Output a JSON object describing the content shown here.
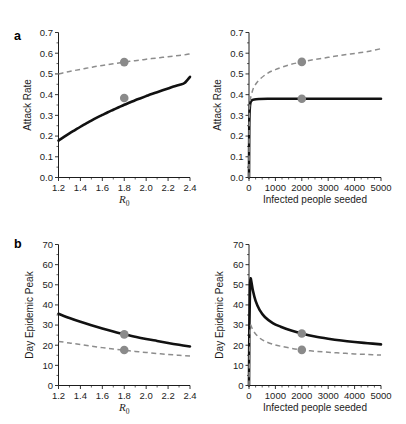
{
  "figure": {
    "background_color": "#ffffff",
    "solid_color": "#111111",
    "dashed_color": "#8d8d8d",
    "marker_color": "#8a8a8a",
    "panel_a_letter": "a",
    "panel_b_letter": "b"
  },
  "chart_data": [
    {
      "id": "panel-a-left",
      "type": "line",
      "panel": "a",
      "title": "",
      "xlabel": "R_0",
      "xlabel_base": "R",
      "xlabel_sub": "0",
      "ylabel": "Attack Rate",
      "xlim": [
        1.2,
        2.4
      ],
      "ylim": [
        0.0,
        0.7
      ],
      "xticks": [
        1.2,
        1.4,
        1.6,
        1.8,
        2.0,
        2.2,
        2.4
      ],
      "xtick_labels": [
        "1.2",
        "1.4",
        "1.6",
        "1.8",
        "2.0",
        "2.2",
        "2.4"
      ],
      "yticks": [
        0.0,
        0.1,
        0.2,
        0.3,
        0.4,
        0.5,
        0.6,
        0.7
      ],
      "ytick_labels": [
        "0.0",
        "0.1",
        "0.2",
        "0.3",
        "0.4",
        "0.5",
        "0.6",
        "0.7"
      ],
      "grid": false,
      "legend": "none",
      "series": [
        {
          "name": "solid",
          "style": "solid",
          "x": [
            1.2,
            1.25,
            1.3,
            1.35,
            1.4,
            1.45,
            1.5,
            1.55,
            1.6,
            1.65,
            1.7,
            1.75,
            1.8,
            1.85,
            1.9,
            1.95,
            2.0,
            2.05,
            2.1,
            2.15,
            2.2,
            2.25,
            2.3,
            2.35,
            2.4
          ],
          "y": [
            0.178,
            0.196,
            0.213,
            0.229,
            0.245,
            0.26,
            0.275,
            0.289,
            0.302,
            0.315,
            0.327,
            0.339,
            0.351,
            0.362,
            0.373,
            0.383,
            0.393,
            0.403,
            0.412,
            0.421,
            0.43,
            0.439,
            0.447,
            0.456,
            0.486
          ]
        },
        {
          "name": "dashed",
          "style": "dashed",
          "x": [
            1.2,
            1.25,
            1.3,
            1.35,
            1.4,
            1.45,
            1.5,
            1.55,
            1.6,
            1.65,
            1.7,
            1.75,
            1.8,
            1.85,
            1.9,
            1.95,
            2.0,
            2.05,
            2.1,
            2.15,
            2.2,
            2.25,
            2.3,
            2.35,
            2.4
          ],
          "y": [
            0.5,
            0.506,
            0.512,
            0.517,
            0.522,
            0.527,
            0.532,
            0.537,
            0.541,
            0.545,
            0.549,
            0.553,
            0.557,
            0.561,
            0.564,
            0.567,
            0.571,
            0.574,
            0.577,
            0.58,
            0.583,
            0.586,
            0.589,
            0.592,
            0.597
          ]
        }
      ],
      "markers": [
        {
          "x": 1.8,
          "y": 0.384,
          "series": "solid"
        },
        {
          "x": 1.8,
          "y": 0.557,
          "series": "dashed"
        }
      ]
    },
    {
      "id": "panel-a-right",
      "type": "line",
      "panel": "a",
      "title": "",
      "xlabel": "Infected people seeded",
      "ylabel": "Attack Rate",
      "xlim": [
        0,
        5000
      ],
      "ylim": [
        0.0,
        0.7
      ],
      "xticks": [
        0,
        1000,
        2000,
        3000,
        4000,
        5000
      ],
      "xtick_labels": [
        "0",
        "1000",
        "2000",
        "3000",
        "4000",
        "5000"
      ],
      "yticks": [
        0.0,
        0.1,
        0.2,
        0.3,
        0.4,
        0.5,
        0.6,
        0.7
      ],
      "ytick_labels": [
        "0.0",
        "0.1",
        "0.2",
        "0.3",
        "0.4",
        "0.5",
        "0.6",
        "0.7"
      ],
      "grid": false,
      "legend": "none",
      "series": [
        {
          "name": "solid",
          "style": "solid",
          "x": [
            0,
            10,
            25,
            50,
            100,
            200,
            400,
            700,
            1000,
            1500,
            2000,
            2500,
            3000,
            3500,
            4000,
            4500,
            5000
          ],
          "y": [
            0.0,
            0.24,
            0.325,
            0.359,
            0.372,
            0.377,
            0.379,
            0.38,
            0.38,
            0.38,
            0.38,
            0.38,
            0.38,
            0.38,
            0.38,
            0.38,
            0.38
          ]
        },
        {
          "name": "dashed",
          "style": "dashed",
          "x": [
            0,
            10,
            25,
            50,
            100,
            200,
            400,
            700,
            1000,
            1500,
            2000,
            2500,
            3000,
            3500,
            4000,
            4500,
            5000
          ],
          "y": [
            0.0,
            0.3,
            0.345,
            0.375,
            0.405,
            0.44,
            0.473,
            0.503,
            0.521,
            0.543,
            0.558,
            0.57,
            0.58,
            0.59,
            0.599,
            0.608,
            0.622
          ]
        }
      ],
      "markers": [
        {
          "x": 2000,
          "y": 0.38,
          "series": "solid"
        },
        {
          "x": 2000,
          "y": 0.558,
          "series": "dashed"
        }
      ]
    },
    {
      "id": "panel-b-left",
      "type": "line",
      "panel": "b",
      "title": "",
      "xlabel": "R_0",
      "xlabel_base": "R",
      "xlabel_sub": "0",
      "ylabel": "Day Epidemic Peak",
      "xlim": [
        1.2,
        2.4
      ],
      "ylim": [
        0,
        70
      ],
      "xticks": [
        1.2,
        1.4,
        1.6,
        1.8,
        2.0,
        2.2,
        2.4
      ],
      "xtick_labels": [
        "1.2",
        "1.4",
        "1.6",
        "1.8",
        "2.0",
        "2.2",
        "2.4"
      ],
      "yticks": [
        0,
        10,
        20,
        30,
        40,
        50,
        60,
        70
      ],
      "ytick_labels": [
        "0",
        "10",
        "20",
        "30",
        "40",
        "50",
        "60",
        "70"
      ],
      "grid": false,
      "legend": "none",
      "series": [
        {
          "name": "solid",
          "style": "solid",
          "x": [
            1.2,
            1.3,
            1.4,
            1.5,
            1.6,
            1.7,
            1.8,
            1.9,
            2.0,
            2.1,
            2.2,
            2.3,
            2.4
          ],
          "y": [
            35.6,
            33.5,
            31.6,
            29.9,
            28.3,
            26.8,
            25.4,
            24.2,
            23.1,
            22.1,
            21.1,
            20.2,
            19.4
          ]
        },
        {
          "name": "dashed",
          "style": "dashed",
          "x": [
            1.2,
            1.3,
            1.4,
            1.5,
            1.6,
            1.7,
            1.8,
            1.9,
            2.0,
            2.1,
            2.2,
            2.3,
            2.4
          ],
          "y": [
            21.9,
            21.1,
            20.3,
            19.5,
            18.8,
            18.1,
            17.5,
            16.9,
            16.4,
            15.9,
            15.4,
            15.0,
            14.6
          ]
        }
      ],
      "markers": [
        {
          "x": 1.8,
          "y": 25.4,
          "series": "solid"
        },
        {
          "x": 1.8,
          "y": 17.6,
          "series": "dashed"
        }
      ]
    },
    {
      "id": "panel-b-right",
      "type": "line",
      "panel": "b",
      "title": "",
      "xlabel": "Infected people seeded",
      "ylabel": "Day Epidemic Peak",
      "xlim": [
        0,
        5000
      ],
      "ylim": [
        0,
        70
      ],
      "xticks": [
        0,
        1000,
        2000,
        3000,
        4000,
        5000
      ],
      "xtick_labels": [
        "0",
        "1000",
        "2000",
        "3000",
        "4000",
        "5000"
      ],
      "yticks": [
        0,
        10,
        20,
        30,
        40,
        50,
        60,
        70
      ],
      "ytick_labels": [
        "0",
        "10",
        "20",
        "30",
        "40",
        "50",
        "60",
        "70"
      ],
      "grid": false,
      "legend": "none",
      "series": [
        {
          "name": "solid",
          "style": "solid",
          "x": [
            0,
            15,
            40,
            60,
            90,
            150,
            250,
            400,
            600,
            900,
            1200,
            1600,
            2000,
            2500,
            3000,
            3500,
            4000,
            4500,
            5000
          ],
          "y": [
            0,
            30,
            50,
            53.2,
            51.5,
            47.0,
            42.0,
            37.5,
            34.0,
            31.0,
            29.2,
            27.3,
            25.8,
            24.3,
            23.2,
            22.3,
            21.6,
            21.0,
            20.4
          ]
        },
        {
          "name": "dashed",
          "style": "dashed",
          "x": [
            0,
            15,
            40,
            60,
            90,
            150,
            250,
            400,
            600,
            900,
            1200,
            1600,
            2000,
            2500,
            3000,
            3500,
            4000,
            4500,
            5000
          ],
          "y": [
            0,
            14,
            26,
            29.8,
            29.3,
            27.5,
            25.6,
            23.6,
            22.0,
            20.5,
            19.5,
            18.5,
            17.7,
            17.0,
            16.5,
            16.1,
            15.7,
            15.4,
            15.1
          ]
        }
      ],
      "markers": [
        {
          "x": 2000,
          "y": 25.8,
          "series": "solid"
        },
        {
          "x": 2000,
          "y": 17.7,
          "series": "dashed"
        }
      ]
    }
  ]
}
